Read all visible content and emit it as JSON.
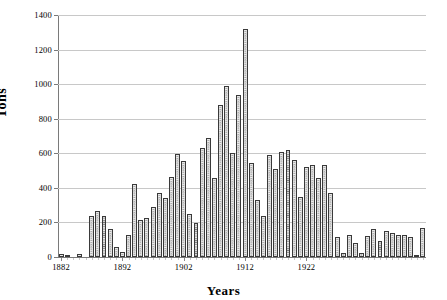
{
  "chart_data": {
    "type": "bar",
    "title": "",
    "xlabel": "Years",
    "ylabel": "Tons",
    "ylim": [
      0,
      1400
    ],
    "ytick_values": [
      0,
      200,
      400,
      600,
      800,
      1000,
      1200,
      1400
    ],
    "ytick_labels": [
      "0",
      "200",
      "400",
      "600",
      "800",
      "1000",
      "1200",
      "1400"
    ],
    "xtick_labels": [
      "1882",
      "1892",
      "1902",
      "1912",
      "1922"
    ],
    "xtick_values": [
      1882,
      1892,
      1902,
      1912,
      1922
    ],
    "grid": "horizontal",
    "legend": "none",
    "bar_style": "cross-hatched",
    "bar_color": "#707070",
    "categories": [
      1882,
      1883,
      1884,
      1885,
      1886,
      1887,
      1888,
      1889,
      1890,
      1891,
      1892,
      1893,
      1894,
      1895,
      1896,
      1897,
      1898,
      1899,
      1900,
      1901,
      1902,
      1903,
      1904,
      1905,
      1906,
      1907,
      1908,
      1909,
      1910,
      1911,
      1912,
      1913,
      1914,
      1915,
      1916,
      1917,
      1918,
      1919,
      1920,
      1921,
      1922,
      1923,
      1924,
      1925,
      1926,
      1927,
      1928,
      1929,
      1930,
      1931,
      1932,
      1933,
      1934,
      1935,
      1936,
      1937,
      1938,
      1939,
      1940,
      1941
    ],
    "values": [
      20,
      5,
      0,
      20,
      0,
      235,
      265,
      235,
      160,
      60,
      30,
      130,
      425,
      215,
      225,
      290,
      370,
      340,
      465,
      595,
      555,
      250,
      195,
      630,
      690,
      460,
      880,
      990,
      600,
      935,
      1320,
      545,
      330,
      240,
      590,
      510,
      605,
      620,
      560,
      345,
      520,
      530,
      460,
      530,
      370,
      115,
      25,
      130,
      80,
      25,
      120,
      160,
      95,
      150,
      140,
      130,
      130,
      115,
      10,
      165
    ],
    "xlim": [
      1881.5,
      1941.5
    ],
    "n_bars": 60
  }
}
